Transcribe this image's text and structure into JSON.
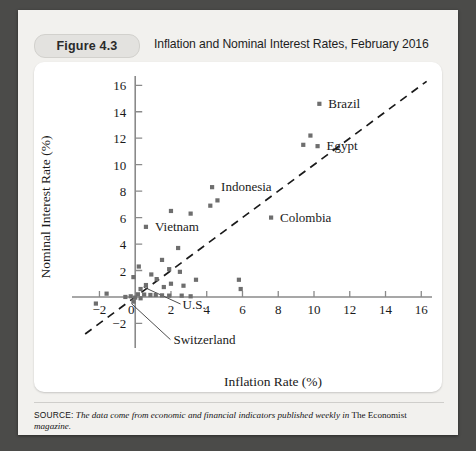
{
  "figure": {
    "tag": "Figure 4.3",
    "title": "Inflation and Nominal Interest Rates, February 2016",
    "source_label": "SOURCE:",
    "source_italic_1": "The data come from economic and financial indicators published weekly in",
    "source_plain": " The Economist ",
    "source_italic_2": "magazine."
  },
  "colors": {
    "page": "#f2f1ee",
    "panel": "#ffffff",
    "marker": "#6e6e6e",
    "axis": "#8a8a8a",
    "reference_line": "#1b1b1b",
    "pill": "#e3e2df",
    "backdrop": "#4b4b49"
  },
  "chart_data": {
    "type": "scatter",
    "title": "Inflation and Nominal Interest Rates, February 2016",
    "xlabel": "Inflation Rate (%)",
    "ylabel": "Nominal Interest Rate (%)",
    "xlim": [
      -3.2,
      16.6
    ],
    "ylim": [
      -2.8,
      16.4
    ],
    "xticks": [
      -2,
      0,
      2,
      4,
      6,
      8,
      10,
      12,
      14,
      16
    ],
    "yticks": [
      -2,
      2,
      4,
      6,
      8,
      10,
      12,
      14,
      16
    ],
    "xtick_labels": [
      "−2",
      "0",
      "2",
      "4",
      "6",
      "8",
      "10",
      "12",
      "14",
      "16"
    ],
    "ytick_labels": [
      "−2",
      "2",
      "4",
      "6",
      "8",
      "10",
      "12",
      "14",
      "16"
    ],
    "grid": false,
    "legend": "none",
    "reference_line": {
      "label": "45-degree line",
      "slope": 1,
      "intercept": 0,
      "style": "dashed",
      "x_start": -2.8,
      "x_end": 16.3
    },
    "points": [
      {
        "x": 10.3,
        "y": 14.6,
        "label": "Brazil"
      },
      {
        "x": 9.8,
        "y": 12.2,
        "label": ""
      },
      {
        "x": 9.4,
        "y": 11.5,
        "label": ""
      },
      {
        "x": 10.2,
        "y": 11.4,
        "label": "Egypt"
      },
      {
        "x": 4.3,
        "y": 8.3,
        "label": "Indonesia"
      },
      {
        "x": 4.6,
        "y": 7.3,
        "label": ""
      },
      {
        "x": 4.2,
        "y": 6.9,
        "label": ""
      },
      {
        "x": 2.0,
        "y": 6.5,
        "label": ""
      },
      {
        "x": 3.1,
        "y": 6.3,
        "label": ""
      },
      {
        "x": 0.6,
        "y": 5.3,
        "label": "Vietnam"
      },
      {
        "x": 7.6,
        "y": 6.0,
        "label": "Colombia"
      },
      {
        "x": 2.4,
        "y": 3.7,
        "label": ""
      },
      {
        "x": 1.5,
        "y": 2.8,
        "label": ""
      },
      {
        "x": 0.2,
        "y": 2.3,
        "label": ""
      },
      {
        "x": 1.9,
        "y": 2.1,
        "label": ""
      },
      {
        "x": 2.5,
        "y": 1.9,
        "label": ""
      },
      {
        "x": 0.9,
        "y": 1.7,
        "label": ""
      },
      {
        "x": -0.1,
        "y": 1.5,
        "label": ""
      },
      {
        "x": 1.2,
        "y": 1.35,
        "label": ""
      },
      {
        "x": 3.4,
        "y": 1.3,
        "label": ""
      },
      {
        "x": 5.8,
        "y": 1.3,
        "label": ""
      },
      {
        "x": 2.0,
        "y": 1.0,
        "label": ""
      },
      {
        "x": 2.7,
        "y": 0.85,
        "label": ""
      },
      {
        "x": 0.6,
        "y": 0.9,
        "label": ""
      },
      {
        "x": 1.6,
        "y": 0.75,
        "label": ""
      },
      {
        "x": 5.9,
        "y": 0.6,
        "label": ""
      },
      {
        "x": 0.3,
        "y": 0.6,
        "label": "U.S."
      },
      {
        "x": -1.6,
        "y": 0.25,
        "label": ""
      },
      {
        "x": 0.15,
        "y": 0.2,
        "label": ""
      },
      {
        "x": 0.5,
        "y": 0.18,
        "label": ""
      },
      {
        "x": 0.85,
        "y": 0.15,
        "label": ""
      },
      {
        "x": 1.15,
        "y": 0.15,
        "label": ""
      },
      {
        "x": 1.5,
        "y": 0.12,
        "label": ""
      },
      {
        "x": 1.9,
        "y": 0.1,
        "label": ""
      },
      {
        "x": 2.6,
        "y": 0.1,
        "label": ""
      },
      {
        "x": 3.1,
        "y": 0.05,
        "label": ""
      },
      {
        "x": -0.25,
        "y": 0.05,
        "label": ""
      },
      {
        "x": -0.55,
        "y": 0.0,
        "label": ""
      },
      {
        "x": 0.0,
        "y": -0.05,
        "label": ""
      },
      {
        "x": 0.3,
        "y": -0.1,
        "label": ""
      },
      {
        "x": -2.2,
        "y": -0.5,
        "label": ""
      },
      {
        "x": -0.1,
        "y": -0.35,
        "label": "Switzerland"
      }
    ],
    "annotations": [
      {
        "text": "Brazil",
        "x": 10.3,
        "y": 14.6
      },
      {
        "text": "Egypt",
        "x": 10.2,
        "y": 11.4
      },
      {
        "text": "Indonesia",
        "x": 4.3,
        "y": 8.3
      },
      {
        "text": "Colombia",
        "x": 7.6,
        "y": 6.0
      },
      {
        "text": "Vietnam",
        "x": 0.6,
        "y": 5.3
      },
      {
        "text": "U.S.",
        "x": 0.3,
        "y": 0.6
      },
      {
        "text": "Switzerland",
        "x": -0.1,
        "y": -0.35
      }
    ]
  }
}
